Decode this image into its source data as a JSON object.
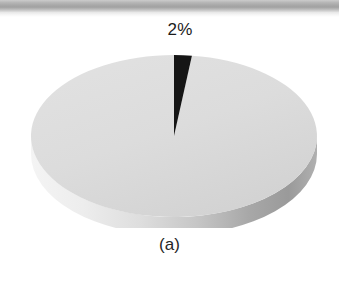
{
  "figure": {
    "caption": "(a)",
    "slice_label": "2%",
    "background_color": "#ffffff"
  },
  "scan_artifact": {
    "name": "page-scan-band",
    "color": "#9d9d9d"
  },
  "chart_data": {
    "type": "pie",
    "title": "",
    "subtitle": "",
    "xlabel": "",
    "ylabel": "",
    "caption": "(a)",
    "categories": [
      "Highlighted segment",
      "Remainder"
    ],
    "values": [
      2,
      98
    ],
    "labels": [
      "2%",
      ""
    ],
    "colors": [
      "#151515",
      "#dcdcdc"
    ],
    "data_labels_shown": [
      "2%"
    ],
    "legend": [],
    "legend_position": "none",
    "grid": false,
    "three_d": true,
    "start_angle_deg": -90,
    "rotation": "first slice at top, clockwise",
    "rim_shading": {
      "left": "#f0f0f0",
      "center": "#cfcfcf",
      "right": "#9a9a9a"
    }
  }
}
